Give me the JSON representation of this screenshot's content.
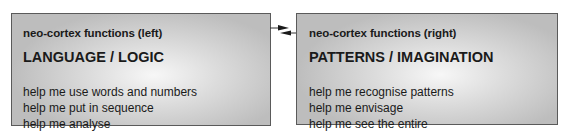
{
  "diagram": {
    "left": {
      "subtitle": "neo-cortex functions (left)",
      "title": "LANGUAGE / LOGIC",
      "items": [
        "help me use words and numbers",
        "help me put in sequence",
        "help me analyse"
      ]
    },
    "right": {
      "subtitle": "neo-cortex functions (right)",
      "title": "PATTERNS / IMAGINATION",
      "items": [
        "help me recognise patterns",
        "help me envisage",
        "help me see the entire"
      ]
    },
    "connector": {
      "type": "bidirectional-arrows",
      "from": "left",
      "to": "right"
    },
    "colors": {
      "border": "#5a5a5a",
      "box_center": "#f7f7f7",
      "box_edge": "#bdbdbd",
      "text": "#1a1a1a"
    }
  }
}
